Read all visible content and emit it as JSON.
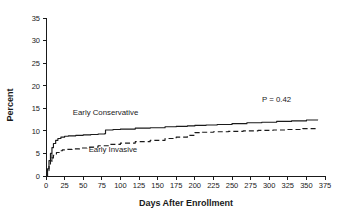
{
  "chart_data": {
    "type": "line",
    "title": "",
    "xlabel": "Days After Enrollment",
    "ylabel": "Percent",
    "xlim": [
      0,
      375
    ],
    "ylim": [
      0,
      35
    ],
    "xticks": [
      0,
      25,
      50,
      75,
      100,
      125,
      150,
      175,
      200,
      225,
      250,
      275,
      300,
      325,
      350,
      375
    ],
    "yticks": [
      0,
      5,
      10,
      15,
      20,
      25,
      30,
      35
    ],
    "xtick_labels": [
      "0",
      "25",
      "50",
      "75",
      "100",
      "125",
      "150",
      "175",
      "200",
      "225",
      "250",
      "275",
      "300",
      "325",
      "350",
      "375"
    ],
    "ytick_labels": [
      "0",
      "5",
      "10",
      "15",
      "20",
      "25",
      "30",
      "35"
    ],
    "grid": false,
    "legend_position": "inline-annotations",
    "annotations": [
      {
        "text": "P = 0.42",
        "x": 310,
        "y": 16.4
      },
      {
        "text": "Early Conservative",
        "x": 80,
        "y": 13.6
      },
      {
        "text": "Early Invasive",
        "x": 90,
        "y": 5.4
      }
    ],
    "series": [
      {
        "name": "Early Conservative",
        "style": "solid",
        "x": [
          0,
          2,
          4,
          6,
          8,
          10,
          13,
          16,
          20,
          25,
          30,
          40,
          50,
          60,
          70,
          79,
          80,
          90,
          100,
          120,
          140,
          160,
          175,
          190,
          200,
          215,
          230,
          250,
          270,
          290,
          310,
          330,
          350,
          365
        ],
        "y": [
          0.0,
          1.6,
          3.4,
          5.0,
          6.3,
          7.2,
          7.9,
          8.3,
          8.6,
          8.8,
          8.9,
          9.0,
          9.1,
          9.2,
          9.3,
          9.4,
          10.2,
          10.3,
          10.4,
          10.6,
          10.7,
          10.9,
          11.0,
          11.1,
          11.2,
          11.3,
          11.4,
          11.6,
          11.8,
          11.9,
          12.1,
          12.2,
          12.4,
          12.5
        ]
      },
      {
        "name": "Early Invasive",
        "style": "dashed",
        "x": [
          0,
          2,
          4,
          6,
          8,
          10,
          14,
          18,
          22,
          28,
          35,
          45,
          55,
          70,
          85,
          100,
          120,
          140,
          160,
          175,
          190,
          200,
          210,
          225,
          245,
          265,
          285,
          305,
          325,
          345,
          365
        ],
        "y": [
          0.0,
          1.2,
          2.5,
          3.4,
          4.0,
          4.6,
          5.2,
          5.6,
          5.8,
          5.9,
          6.0,
          6.2,
          6.4,
          6.7,
          7.0,
          7.3,
          7.6,
          7.9,
          8.3,
          8.6,
          9.0,
          9.6,
          9.7,
          9.8,
          9.9,
          10.0,
          10.1,
          10.2,
          10.3,
          10.5,
          10.7
        ]
      }
    ],
    "censor_marks": [
      {
        "series": "Early Invasive",
        "x": 8,
        "y": 4.0
      }
    ]
  }
}
